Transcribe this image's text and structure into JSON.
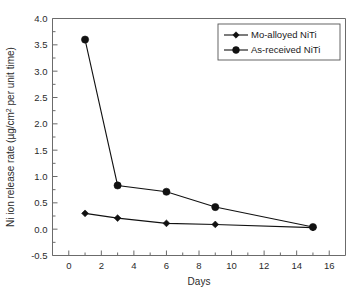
{
  "chart_data": {
    "type": "line",
    "title": "",
    "subtitle": "",
    "xlabel": "Days",
    "ylabel": "Ni ion release rate (µg/cm² per unit time)",
    "ylabel_parts": {
      "before": "Ni ion release rate (µg/cm",
      "superscript": "2",
      "after": " per unit time)"
    },
    "x": [
      1,
      3,
      6,
      9,
      15
    ],
    "xlim": [
      -1,
      17
    ],
    "ylim": [
      -0.5,
      4.0
    ],
    "grid": false,
    "legend_position": "top-right",
    "xticks": [
      0,
      2,
      4,
      6,
      8,
      10,
      12,
      14,
      16
    ],
    "xtick_labels": [
      "0",
      "2",
      "4",
      "6",
      "8",
      "10",
      "12",
      "14",
      "16"
    ],
    "xminor_ticks": [
      -1,
      1,
      3,
      5,
      7,
      9,
      11,
      13,
      15,
      17
    ],
    "yticks": [
      -0.5,
      0.0,
      0.5,
      1.0,
      1.5,
      2.0,
      2.5,
      3.0,
      3.5,
      4.0
    ],
    "ytick_labels": [
      "-0.5",
      "0.0",
      "0.5",
      "1.0",
      "1.5",
      "2.0",
      "2.5",
      "3.0",
      "3.5",
      "4.0"
    ],
    "yminor_ticks": [
      -0.25,
      0.25,
      0.75,
      1.25,
      1.75,
      2.25,
      2.75,
      3.25,
      3.75
    ],
    "series": [
      {
        "name": "Mo-alloyed NiTi",
        "marker": "diamond",
        "color": "#111111",
        "values": [
          0.3,
          0.21,
          0.11,
          0.09,
          0.03
        ]
      },
      {
        "name": "As-received NiTi",
        "marker": "circle",
        "color": "#111111",
        "values": [
          3.6,
          0.83,
          0.71,
          0.42,
          0.04
        ]
      }
    ]
  },
  "legend": {
    "entries": [
      {
        "label": "Mo-alloyed NiTi",
        "marker": "diamond"
      },
      {
        "label": "As-received NiTi",
        "marker": "circle"
      }
    ]
  },
  "colors": {
    "background": "#ffffff",
    "axis": "#6b6b6b",
    "data": "#111111",
    "text": "#2b2b2b"
  }
}
